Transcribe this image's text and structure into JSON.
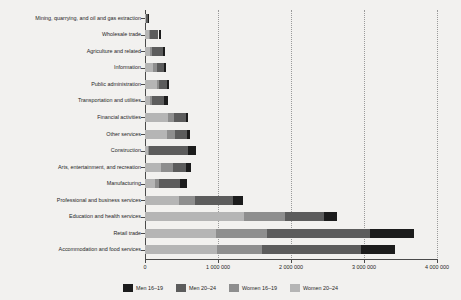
{
  "chart_data": {
    "type": "bar",
    "orientation": "horizontal",
    "stacked": true,
    "title": "",
    "xlabel": "",
    "ylabel": "",
    "xlim": [
      0,
      4000000
    ],
    "grid": true,
    "legend_position": "bottom",
    "xticks": [
      0,
      1000000,
      2000000,
      3000000,
      4000000
    ],
    "xtick_labels": [
      "0",
      "1 000 000",
      "2 000 000",
      "3 000 000",
      "4 000 000"
    ],
    "categories": [
      "Mining, quarrying, and oil and gas extraction",
      "Wholesale trade",
      "Agriculture and related",
      "Information",
      "Public administration",
      "Transportation and utilities",
      "Financial activities",
      "Other services",
      "Construction",
      "Arts, entertainment, and recreation",
      "Manufacturing",
      "Professional and business services",
      "Education and health services",
      "Retail trade",
      "Accommodation and food services"
    ],
    "series": [
      {
        "name": "Women 20–24",
        "color": "#b5b5b5",
        "values": [
          10000,
          60000,
          70000,
          115000,
          160000,
          75000,
          310000,
          300000,
          40000,
          225000,
          135000,
          470000,
          1360000,
          975000,
          985000
        ]
      },
      {
        "name": "Women 16–19",
        "color": "#8e8e8e",
        "values": [
          5000,
          15000,
          25000,
          45000,
          35000,
          25000,
          85000,
          115000,
          20000,
          155000,
          55000,
          210000,
          560000,
          700000,
          620000
        ]
      },
      {
        "name": "Men 20–24",
        "color": "#5c5c5c",
        "values": [
          30000,
          110000,
          145000,
          95000,
          105000,
          160000,
          160000,
          155000,
          530000,
          180000,
          290000,
          520000,
          530000,
          1410000,
          1360000
        ]
      },
      {
        "name": "Men 16–19",
        "color": "#1c1c1c",
        "values": [
          8000,
          35000,
          40000,
          30000,
          25000,
          50000,
          35000,
          40000,
          115000,
          70000,
          95000,
          140000,
          180000,
          605000,
          465000
        ]
      }
    ],
    "segment_order": [
      "Women 20–24",
      "Women 16–19",
      "Men 20–24",
      "Men 16–19"
    ],
    "totals": [
      53000,
      220000,
      280000,
      285000,
      325000,
      310000,
      590000,
      610000,
      705000,
      630000,
      575000,
      1340000,
      2630000,
      3690000,
      3430000
    ]
  },
  "legend": {
    "items": [
      {
        "label": "Men 16–19",
        "color": "#1c1c1c"
      },
      {
        "label": "Men 20–24",
        "color": "#5c5c5c"
      },
      {
        "label": "Women 16–19",
        "color": "#8e8e8e"
      },
      {
        "label": "Women 20–24",
        "color": "#b5b5b5"
      }
    ]
  },
  "colors": {
    "background": "#f2f1ef",
    "axis": "#4a4a4a",
    "grid": "#9a9a9a",
    "text": "#1f1f1f"
  }
}
